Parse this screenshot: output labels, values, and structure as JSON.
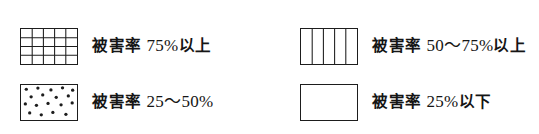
{
  "legend": {
    "title": "被害率凡例",
    "background_color": "#ffffff",
    "line_color": "#1d1d1d",
    "text_color": "#151515",
    "items": [
      {
        "id": "damage-over-75",
        "pattern": "grid",
        "pattern_name": "cross-hatch-grid",
        "prefix": "被害率",
        "value": "75%",
        "suffix": "以上",
        "full_label": "被害率 75%以上",
        "row": 1,
        "column": 1
      },
      {
        "id": "damage-50-75",
        "pattern": "vertical-lines",
        "pattern_name": "vertical-stripes",
        "prefix": "被害率",
        "value": "50〜75%",
        "suffix": "以上",
        "full_label": "被害率 50〜75%以上",
        "row": 1,
        "column": 2
      },
      {
        "id": "damage-25-50",
        "pattern": "dots",
        "pattern_name": "stipple-dots",
        "prefix": "被害率",
        "value": "25〜50%",
        "suffix": "",
        "full_label": "被害率 25〜50%",
        "row": 2,
        "column": 1
      },
      {
        "id": "damage-under-25",
        "pattern": "blank",
        "pattern_name": "empty-rectangle",
        "prefix": "被害率",
        "value": "25%",
        "suffix": "以下",
        "full_label": "被害率 25%以下",
        "row": 2,
        "column": 2
      }
    ]
  }
}
